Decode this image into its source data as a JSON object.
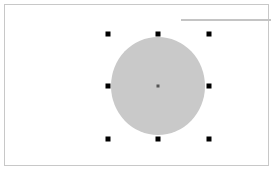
{
  "canvas": {
    "background": "#ffffff",
    "frame_border": "#c8c8c8"
  },
  "guide_line": {
    "color": "#c4c4c4"
  },
  "selected_shape": {
    "type": "ellipse",
    "fill": "#c9c9c9",
    "center": [
      158,
      86
    ],
    "width": 94,
    "height": 98
  },
  "selection_handles": [
    {
      "position": "top-left",
      "x": 108,
      "y": 34
    },
    {
      "position": "top-center",
      "x": 158,
      "y": 34
    },
    {
      "position": "top-right",
      "x": 209,
      "y": 34
    },
    {
      "position": "middle-left",
      "x": 108,
      "y": 86
    },
    {
      "position": "middle-right",
      "x": 209,
      "y": 86
    },
    {
      "position": "bottom-left",
      "x": 108,
      "y": 139
    },
    {
      "position": "bottom-center",
      "x": 158,
      "y": 139
    },
    {
      "position": "bottom-right",
      "x": 209,
      "y": 139
    }
  ],
  "handle_color": "#000000"
}
